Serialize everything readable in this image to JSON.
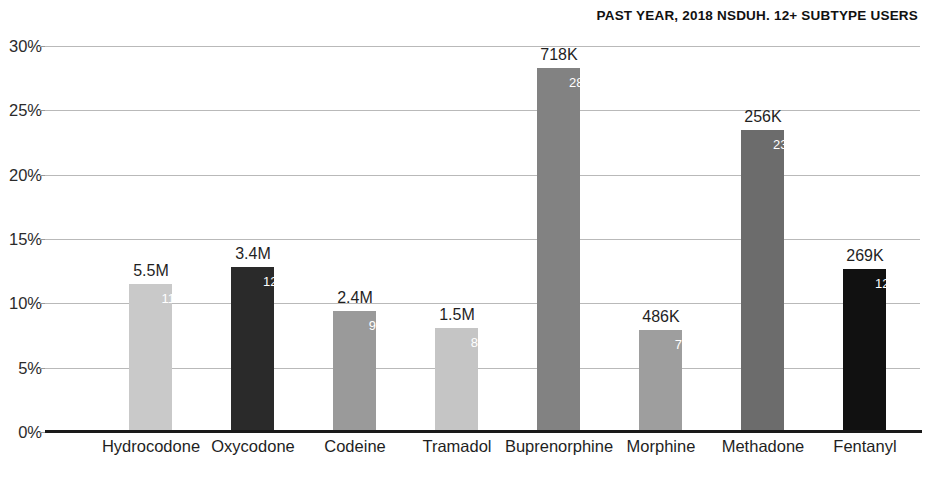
{
  "chart": {
    "title": "PAST YEAR, 2018 NSDUH. 12+ SUBTYPE USERS"
  },
  "chart_data": {
    "type": "bar",
    "title": "PAST YEAR, 2018 NSDUH. 12+ SUBTYPE USERS",
    "xlabel": "",
    "ylabel": "",
    "ylim": [
      0,
      30
    ],
    "ytick_labels": [
      "30%",
      "25%",
      "20%",
      "15%",
      "10%",
      "5%",
      "0%"
    ],
    "ytick_values": [
      30,
      25,
      20,
      15,
      10,
      5,
      0
    ],
    "grid": true,
    "legend": "none",
    "categories": [
      "Hydrocodone",
      "Oxycodone",
      "Codeine",
      "Tramadol",
      "Buprenorphine",
      "Morphine",
      "Methadone",
      "Fentanyl"
    ],
    "values": [
      11.5,
      12.8,
      9.4,
      8.1,
      28.3,
      7.9,
      23.5,
      12.7
    ],
    "value_labels": [
      "11.5%",
      "12.8%",
      "9.4%",
      "8.1%",
      "28.3%",
      "7.9%",
      "23.5%",
      "12.7%"
    ],
    "count_labels": [
      "5.5M",
      "3.4M",
      "2.4M",
      "1.5M",
      "718K",
      "486K",
      "256K",
      "269K"
    ],
    "bar_colors": [
      "#c9c9c9",
      "#2a2a2a",
      "#9a9a9a",
      "#c5c5c5",
      "#828282",
      "#9e9e9e",
      "#6c6c6c",
      "#111111"
    ],
    "bars": [
      {
        "category": "Hydrocodone",
        "value": 11.5,
        "value_label": "11.5%",
        "count_label": "5.5M",
        "color": "#c9c9c9"
      },
      {
        "category": "Oxycodone",
        "value": 12.8,
        "value_label": "12.8%",
        "count_label": "3.4M",
        "color": "#2a2a2a"
      },
      {
        "category": "Codeine",
        "value": 9.4,
        "value_label": "9.4%",
        "count_label": "2.4M",
        "color": "#9a9a9a"
      },
      {
        "category": "Tramadol",
        "value": 8.1,
        "value_label": "8.1%",
        "count_label": "1.5M",
        "color": "#c5c5c5"
      },
      {
        "category": "Buprenorphine",
        "value": 28.3,
        "value_label": "28.3%",
        "count_label": "718K",
        "color": "#828282"
      },
      {
        "category": "Morphine",
        "value": 7.9,
        "value_label": "7.9%",
        "count_label": "486K",
        "color": "#9e9e9e"
      },
      {
        "category": "Methadone",
        "value": 23.5,
        "value_label": "23.5%",
        "count_label": "256K",
        "color": "#6c6c6c"
      },
      {
        "category": "Fentanyl",
        "value": 12.7,
        "value_label": "12.7%",
        "count_label": "269K",
        "color": "#111111"
      }
    ]
  },
  "colors": {
    "background": "#ffffff",
    "axis": "#1a1a1a",
    "grid": "#b9b9b9",
    "text": "#1f1f1f",
    "value_label": "#ffffff"
  }
}
